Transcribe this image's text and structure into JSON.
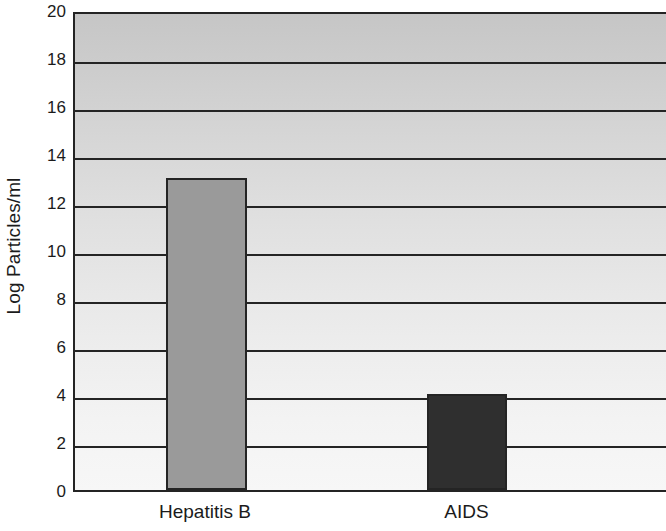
{
  "chart_data": {
    "type": "bar",
    "title": "",
    "subtitle": "",
    "xlabel": "",
    "ylabel": "Log Particles/ml",
    "categories": [
      "Hepatitis B",
      "AIDS"
    ],
    "values": [
      13,
      4
    ],
    "bar_colors": [
      "#9a9a9a",
      "#2f2f2f"
    ],
    "bar_edge_color": "#242424",
    "ylim": [
      0,
      20
    ],
    "yticks": [
      0,
      2,
      4,
      6,
      8,
      10,
      12,
      14,
      16,
      18,
      20
    ],
    "ytick_labels": [
      "0",
      "2",
      "4",
      "6",
      "8",
      "10",
      "12",
      "14",
      "16",
      "18",
      "20"
    ],
    "grid": {
      "horizontal": true,
      "vertical": false,
      "color": "#242424"
    },
    "legend": {
      "visible": false,
      "position": "none",
      "entries": []
    },
    "annotations": [],
    "plot_background": {
      "type": "vertical-gradient",
      "top_color": "#c6c6c6",
      "bottom_color": "#f7f7f7"
    },
    "bars": [
      {
        "category": "Hepatitis B",
        "value": 13,
        "color": "#9a9a9a",
        "center_fraction": 0.2225,
        "width_fraction": 0.1385
      },
      {
        "category": "AIDS",
        "value": 4,
        "color": "#2f2f2f",
        "center_fraction": 0.6635,
        "width_fraction": 0.1365
      }
    ]
  }
}
